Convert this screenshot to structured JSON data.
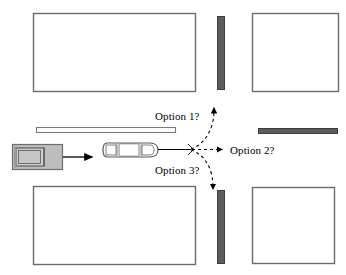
{
  "diagram": {
    "type": "traffic-intersection-decision-diagram",
    "background_color": "#ffffff",
    "stroke_color": "#595959",
    "barrier_color": "#595959",
    "vehicle_fill": "#bdbdbd",
    "line_color": "#000000",
    "labels": {
      "option_1": "Option 1?",
      "option_2": "Option 2?",
      "option_3": "Option 3?"
    },
    "buildings": [
      {
        "name": "building-top-left",
        "x": 33,
        "y": 13,
        "w": 162,
        "h": 78
      },
      {
        "name": "building-top-right",
        "x": 252,
        "y": 13,
        "w": 86,
        "h": 78
      },
      {
        "name": "building-bottom-left",
        "x": 33,
        "y": 186,
        "w": 162,
        "h": 78
      },
      {
        "name": "building-bottom-right",
        "x": 252,
        "y": 187,
        "w": 82,
        "h": 76
      }
    ],
    "barriers": [
      {
        "name": "barrier-vertical-top",
        "x": 217,
        "y": 16,
        "w": 8,
        "h": 73
      },
      {
        "name": "barrier-vertical-bottom",
        "x": 217,
        "y": 190,
        "w": 8,
        "h": 73
      },
      {
        "name": "barrier-horizontal-right",
        "x": 258,
        "y": 128,
        "w": 80,
        "h": 5
      }
    ],
    "medians": [
      {
        "name": "median-horizontal-left",
        "x": 36,
        "y": 127,
        "w": 140,
        "h": 6
      }
    ],
    "vehicles": [
      {
        "name": "vehicle-gray-van",
        "x": 12,
        "y": 144,
        "w": 50,
        "h": 25,
        "heading": "east",
        "style": "filled"
      },
      {
        "name": "vehicle-white-car",
        "x": 104,
        "y": 139,
        "w": 54,
        "h": 22,
        "heading": "east",
        "style": "outline"
      }
    ],
    "paths": [
      {
        "name": "path-van-heading-arrow",
        "style": "solid",
        "from": [
          62,
          156
        ],
        "to": [
          95,
          156
        ]
      },
      {
        "name": "path-car-heading-line",
        "style": "solid",
        "from": [
          158,
          149
        ],
        "to": [
          191,
          149
        ]
      },
      {
        "name": "path-option-1",
        "style": "dashed",
        "label": "Option 1?",
        "direction": "left-turn-north"
      },
      {
        "name": "path-option-2",
        "style": "dashed",
        "label": "Option 2?",
        "direction": "straight-east"
      },
      {
        "name": "path-option-3",
        "style": "dashed",
        "label": "Option 3?",
        "direction": "right-turn-south"
      }
    ],
    "decision_point": [
      191,
      149
    ]
  }
}
